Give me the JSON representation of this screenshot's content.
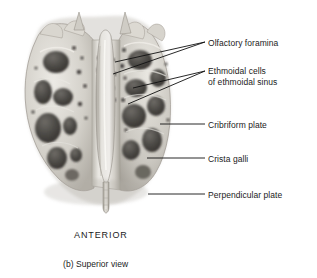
{
  "figure": {
    "caption": "(b) Superior view",
    "orientation_marker": "ANTERIOR",
    "background_color": "#ffffff",
    "text_color": "#1b1b1b",
    "leader_line_color": "#111111"
  },
  "labels": [
    {
      "id": "olfactory-foramina",
      "text": "Olfactory foramina",
      "lines": [
        "Olfactory foramina"
      ]
    },
    {
      "id": "ethmoidal-cells",
      "text": "Ethmoidal cells\nof ethmoidal sinus",
      "lines": [
        "Ethmoidal cells",
        "of ethmoidal sinus"
      ]
    },
    {
      "id": "cribriform-plate",
      "text": "Cribriform plate",
      "lines": [
        "Cribriform plate"
      ]
    },
    {
      "id": "crista-galli",
      "text": "Crista galli",
      "lines": [
        "Crista galli"
      ]
    },
    {
      "id": "perpendicular-plate",
      "text": "Perpendicular plate",
      "lines": [
        "Perpendicular plate"
      ]
    }
  ],
  "specimen": {
    "name": "ethmoid-bone",
    "view": "superior",
    "palette": {
      "bone_light": "#e4e2dd",
      "bone_mid": "#c3c0b9",
      "bone_shadow": "#9a968e",
      "cavity_dark": "#55524d",
      "cavity_deep": "#3a3835",
      "outline": "#8d8981"
    }
  }
}
